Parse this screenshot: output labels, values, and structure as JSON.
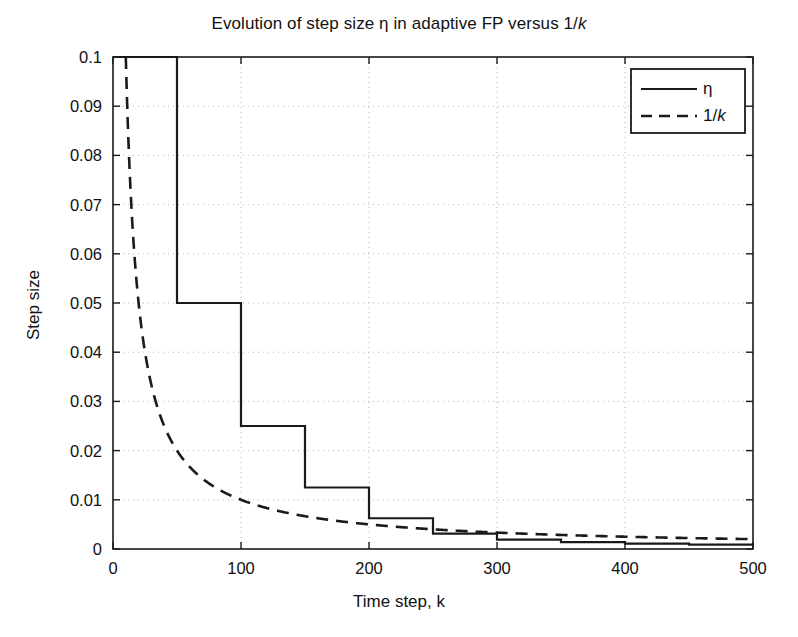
{
  "chart_data": {
    "type": "line",
    "title": "Evolution of step size η in adaptive FP versus 1/k",
    "title_prefix": "Evolution of step size η in adaptive FP versus 1/",
    "title_italic": "k",
    "xlabel_prefix": "Time step, ",
    "xlabel_italic": "k",
    "xlabel": "Time step, k",
    "ylabel": "Step size",
    "xlim": [
      0,
      500
    ],
    "ylim": [
      0,
      0.1
    ],
    "grid": true,
    "grid_style": "dotted",
    "grid_color": "#b4b4b4",
    "legend_position": "top-right",
    "xticks": [
      0,
      100,
      200,
      300,
      400,
      500
    ],
    "xtick_labels": [
      "0",
      "100",
      "200",
      "300",
      "400",
      "500"
    ],
    "yticks": [
      0,
      0.01,
      0.02,
      0.03,
      0.04,
      0.05,
      0.06,
      0.07,
      0.08,
      0.09,
      0.1
    ],
    "ytick_labels": [
      "0",
      "0.01",
      "0.02",
      "0.03",
      "0.04",
      "0.05",
      "0.06",
      "0.07",
      "0.08",
      "0.09",
      "0.1"
    ],
    "series": [
      {
        "name": "η",
        "style": "solid",
        "color": "#1a1a1a",
        "linewidth": 2.2,
        "shape": "step",
        "breakpoints": [
          0,
          50,
          100,
          150,
          200,
          250,
          300,
          350,
          400,
          450,
          500
        ],
        "values": [
          0.1,
          0.05,
          0.025,
          0.0125,
          0.00625,
          0.003125,
          0.0019,
          0.0014,
          0.0011,
          0.0009,
          0.0009
        ]
      },
      {
        "name": "1/k",
        "name_prefix": "1/",
        "name_italic": "k",
        "style": "dashed",
        "color": "#1a1a1a",
        "linewidth": 2.6,
        "shape": "hyperbola",
        "formula": "y = 1/k",
        "x": [
          10,
          12,
          15,
          20,
          25,
          30,
          40,
          50,
          60,
          75,
          100,
          125,
          150,
          175,
          200,
          250,
          300,
          350,
          400,
          450,
          500
        ],
        "values": [
          0.1,
          0.0833,
          0.0667,
          0.05,
          0.04,
          0.0333,
          0.025,
          0.02,
          0.0167,
          0.0133,
          0.01,
          0.008,
          0.00667,
          0.00571,
          0.005,
          0.004,
          0.00333,
          0.00286,
          0.0025,
          0.00222,
          0.002
        ]
      }
    ]
  },
  "legend": {
    "entries": [
      {
        "label": "η",
        "label_prefix": "η",
        "label_italic": "",
        "style": "solid"
      },
      {
        "label": "1/k",
        "label_prefix": "1/",
        "label_italic": "k",
        "style": "dashed"
      }
    ]
  }
}
